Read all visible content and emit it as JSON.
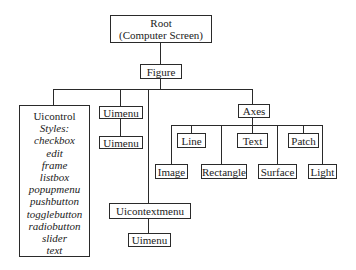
{
  "diagram": {
    "nodes": {
      "root": {
        "line1": "Root",
        "line2": "(Computer Screen)"
      },
      "figure": {
        "label": "Figure"
      },
      "uicontrol": {
        "label": "Uicontrol",
        "styles_label": "Styles:",
        "styles": [
          "checkbox",
          "edit",
          "frame",
          "listbox",
          "popupmenu",
          "pushbutton",
          "togglebutton",
          "radiobutton",
          "slider",
          "text"
        ]
      },
      "uimenu_1": {
        "label": "Uimenu"
      },
      "uimenu_2": {
        "label": "Uimenu"
      },
      "uicontextmenu": {
        "label": "Uicontextmenu"
      },
      "uimenu_3": {
        "label": "Uimenu"
      },
      "axes": {
        "label": "Axes"
      },
      "line": {
        "label": "Line"
      },
      "text": {
        "label": "Text"
      },
      "patch": {
        "label": "Patch"
      },
      "image": {
        "label": "Image"
      },
      "rectangle": {
        "label": "Rectangle"
      },
      "surface": {
        "label": "Surface"
      },
      "light": {
        "label": "Light"
      }
    },
    "edges": [
      [
        "root",
        "figure"
      ],
      [
        "figure",
        "uicontrol"
      ],
      [
        "figure",
        "uimenu_1"
      ],
      [
        "figure",
        "uicontextmenu"
      ],
      [
        "figure",
        "axes"
      ],
      [
        "uimenu_1",
        "uimenu_2"
      ],
      [
        "uicontextmenu",
        "uimenu_3"
      ],
      [
        "axes",
        "line"
      ],
      [
        "axes",
        "text"
      ],
      [
        "axes",
        "patch"
      ],
      [
        "axes",
        "image"
      ],
      [
        "axes",
        "rectangle"
      ],
      [
        "axes",
        "surface"
      ],
      [
        "axes",
        "light"
      ]
    ]
  }
}
